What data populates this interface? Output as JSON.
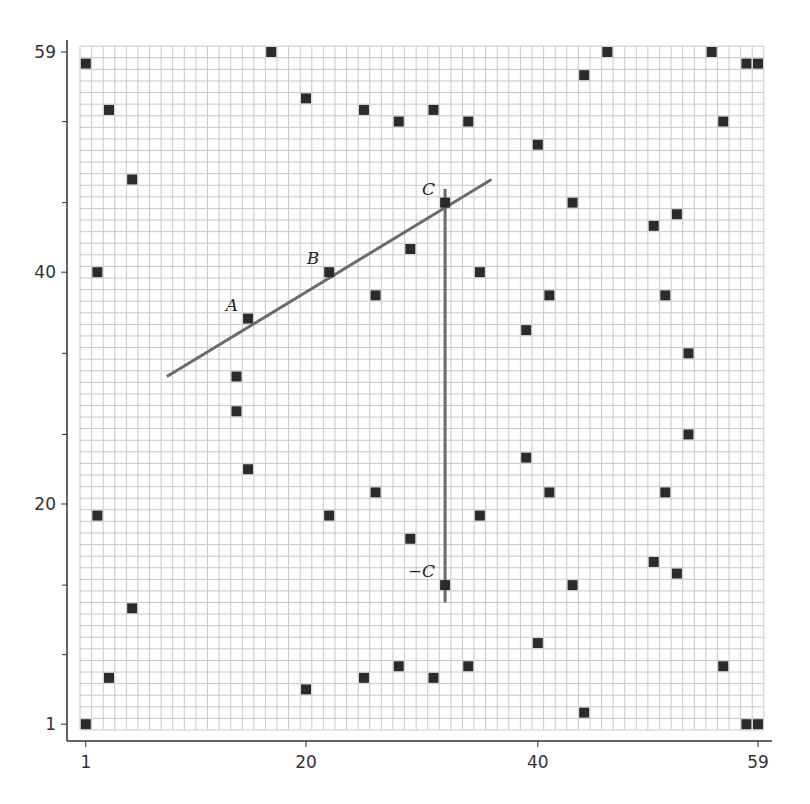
{
  "chart_data": {
    "type": "scatter",
    "title": "",
    "xlabel": "",
    "ylabel": "",
    "xlim": [
      1,
      59
    ],
    "ylim": [
      1,
      59
    ],
    "grid": true,
    "grid_size": 59,
    "x_tick_labels": [
      "1",
      "20",
      "40",
      "59"
    ],
    "x_ticks": [
      1,
      20,
      40,
      59
    ],
    "y_tick_labels": [
      "1",
      "20",
      "40",
      "59"
    ],
    "y_ticks": [
      1,
      20,
      40,
      59
    ],
    "y_minor_ticks": [
      7,
      13,
      26,
      33,
      46,
      53
    ],
    "marker": "filled-square",
    "marker_color": "#2b2b2b",
    "line_color": "#6b6b6b",
    "grid_color": "#c8c8c8",
    "points": [
      [
        1,
        58
      ],
      [
        3,
        54
      ],
      [
        5,
        48
      ],
      [
        17,
        59
      ],
      [
        20,
        55
      ],
      [
        25,
        54
      ],
      [
        28,
        53
      ],
      [
        31,
        54
      ],
      [
        34,
        53
      ],
      [
        40,
        51
      ],
      [
        44,
        57
      ],
      [
        46,
        59
      ],
      [
        55,
        59
      ],
      [
        58,
        58
      ],
      [
        59,
        58
      ],
      [
        56,
        53
      ],
      [
        43,
        46
      ],
      [
        50,
        44
      ],
      [
        52,
        45
      ],
      [
        2,
        40
      ],
      [
        22,
        40
      ],
      [
        29,
        42
      ],
      [
        35,
        40
      ],
      [
        32,
        46
      ],
      [
        15,
        36
      ],
      [
        26,
        38
      ],
      [
        41,
        38
      ],
      [
        51,
        38
      ],
      [
        39,
        35
      ],
      [
        53,
        33
      ],
      [
        14,
        31
      ],
      [
        14,
        28
      ],
      [
        15,
        23
      ],
      [
        39,
        24
      ],
      [
        53,
        26
      ],
      [
        2,
        19
      ],
      [
        26,
        21
      ],
      [
        22,
        19
      ],
      [
        29,
        17
      ],
      [
        35,
        19
      ],
      [
        41,
        21
      ],
      [
        51,
        21
      ],
      [
        32,
        13
      ],
      [
        50,
        15
      ],
      [
        52,
        14
      ],
      [
        43,
        13
      ],
      [
        5,
        11
      ],
      [
        40,
        8
      ],
      [
        3,
        5
      ],
      [
        20,
        4
      ],
      [
        25,
        5
      ],
      [
        28,
        6
      ],
      [
        31,
        5
      ],
      [
        34,
        6
      ],
      [
        56,
        6
      ],
      [
        44,
        2
      ],
      [
        1,
        1
      ],
      [
        58,
        1
      ],
      [
        59,
        1
      ]
    ],
    "annotations": [
      {
        "label": "A",
        "x": 15,
        "y": 36
      },
      {
        "label": "B",
        "x": 22,
        "y": 40
      },
      {
        "label": "C",
        "x": 32,
        "y": 46
      },
      {
        "label": "−C",
        "x": 32,
        "y": 13
      }
    ],
    "lines": [
      {
        "name": "line-through-A-B-C",
        "from": [
          8,
          31
        ],
        "to": [
          36,
          48
        ]
      },
      {
        "name": "vertical-C-to-negC",
        "from": [
          32,
          47.2
        ],
        "to": [
          32,
          11.5
        ]
      }
    ]
  }
}
